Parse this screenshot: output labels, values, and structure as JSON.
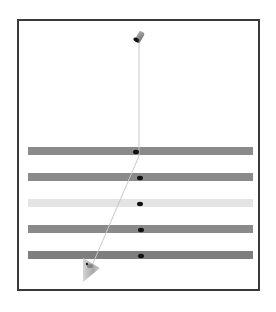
{
  "scene": {
    "type": "3d-render",
    "background": "#ffffff",
    "frame_color": "#3a3a3a",
    "emitter": {
      "name": "cylinder-emitter",
      "x": 139,
      "y": 38,
      "color": "#8a8a8a",
      "cap_color": "#111111"
    },
    "ray": {
      "color": "#c8c8c8",
      "points": [
        [
          139,
          40
        ],
        [
          139,
          156
        ],
        [
          91,
          268
        ]
      ]
    },
    "bars": [
      {
        "y": 151,
        "color": "#8a8a8a",
        "dot_x": 136
      },
      {
        "y": 177,
        "color": "#8a8a8a",
        "dot_x": 140
      },
      {
        "y": 203,
        "color": "#e4e4e4",
        "dot_x": 140
      },
      {
        "y": 229,
        "color": "#8a8a8a",
        "dot_x": 141
      },
      {
        "y": 255,
        "color": "#7e7e7e",
        "dot_x": 141
      }
    ],
    "bar_x_start": 28,
    "bar_x_end": 253,
    "bar_height": 8,
    "cone": {
      "name": "cone-receiver",
      "x": 90,
      "y": 270,
      "color": "#b0b0b0"
    }
  }
}
